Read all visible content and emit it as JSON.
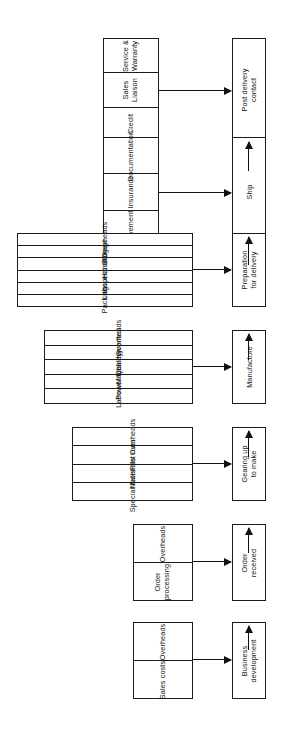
{
  "diagram": {
    "orientation": "rotated-90",
    "line_color": "#1b1b1b",
    "background_color": "#ffffff",
    "stages": [
      {
        "id": "post-delivery-contact",
        "process": "Post delivery contact",
        "components": [
          "Service & Warranty",
          "Sales Liaison",
          "Credit"
        ]
      },
      {
        "id": "ship",
        "process": "Ship",
        "components": [
          "Documentation",
          "Insurance",
          "Movement"
        ]
      },
      {
        "id": "preparation-for-delivery",
        "process": "Preparation for delivery",
        "components": [
          "Overheads",
          "Storage",
          "Handling",
          "Inspection",
          "Labour",
          "Packing"
        ]
      },
      {
        "id": "manufacture",
        "process": "Manufacture",
        "components": [
          "Overheads",
          "Quality control",
          "Machinery",
          "Power/fuel",
          "Labour"
        ]
      },
      {
        "id": "gearing-up-to-make",
        "process": "Gearing up to make",
        "components": [
          "Overheads",
          "Pilot runs",
          "Materials",
          "Special tools"
        ]
      },
      {
        "id": "order-received",
        "process": "Order received",
        "components": [
          "Overheads",
          "Order processing"
        ]
      },
      {
        "id": "business-development",
        "process": "Business development",
        "components": [
          "Overheads",
          "Sales costs"
        ]
      }
    ]
  }
}
